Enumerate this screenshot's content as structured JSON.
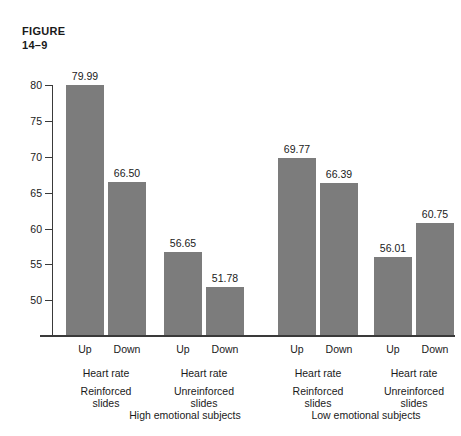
{
  "figure": {
    "line1": "FIGURE",
    "line2": "14–9"
  },
  "chart_data": {
    "type": "bar",
    "title": "",
    "xlabel": "",
    "ylabel": "",
    "ylim": [
      48,
      82
    ],
    "yticks": [
      50,
      55,
      60,
      65,
      70,
      75,
      80
    ],
    "ytick_labels": [
      "50",
      "55",
      "60",
      "65",
      "70",
      "75",
      "80"
    ],
    "grid": false,
    "legend": null,
    "bar_color": "#7c7c7c",
    "categories": [
      "High emotional / Reinforced slides / Up",
      "High emotional / Reinforced slides / Down",
      "High emotional / Unreinforced slides / Up",
      "High emotional / Unreinforced slides / Down",
      "Low emotional / Reinforced slides / Up",
      "Low emotional / Reinforced slides / Down",
      "Low emotional / Unreinforced slides / Up",
      "Low emotional / Unreinforced slides / Down"
    ],
    "values": [
      79.99,
      66.5,
      56.65,
      51.78,
      69.77,
      66.39,
      56.01,
      60.75
    ],
    "value_labels": [
      "79.99",
      "66.50",
      "56.65",
      "51.78",
      "69.77",
      "66.39",
      "56.01",
      "60.75"
    ],
    "groups": [
      {
        "label": "High emotional subjects",
        "subgroups": [
          {
            "label_line1": "Reinforced",
            "label_line2": "slides",
            "measure": "Heart rate",
            "bars": [
              {
                "direction": "Up",
                "value": 79.99,
                "value_label": "79.99"
              },
              {
                "direction": "Down",
                "value": 66.5,
                "value_label": "66.50"
              }
            ]
          },
          {
            "label_line1": "Unreinforced",
            "label_line2": "slides",
            "measure": "Heart rate",
            "bars": [
              {
                "direction": "Up",
                "value": 56.65,
                "value_label": "56.65"
              },
              {
                "direction": "Down",
                "value": 51.78,
                "value_label": "51.78"
              }
            ]
          }
        ]
      },
      {
        "label": "Low emotional subjects",
        "subgroups": [
          {
            "label_line1": "Reinforced",
            "label_line2": "slides",
            "measure": "Heart rate",
            "bars": [
              {
                "direction": "Up",
                "value": 69.77,
                "value_label": "69.77"
              },
              {
                "direction": "Down",
                "value": 66.39,
                "value_label": "66.39"
              }
            ]
          },
          {
            "label_line1": "Unreinforced",
            "label_line2": "slides",
            "measure": "Heart rate",
            "bars": [
              {
                "direction": "Up",
                "value": 56.01,
                "value_label": "56.01"
              },
              {
                "direction": "Down",
                "value": 60.75,
                "value_label": "60.75"
              }
            ]
          }
        ]
      }
    ]
  }
}
